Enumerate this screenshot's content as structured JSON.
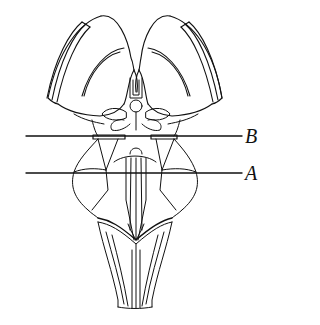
{
  "figure": {
    "stroke_color": "#111111",
    "background": "#ffffff"
  },
  "section_lines": [
    {
      "id": "B",
      "label": "B",
      "y": 136
    },
    {
      "id": "A",
      "label": "A",
      "y": 173
    }
  ],
  "labels": {
    "b": "B",
    "a": "A"
  }
}
